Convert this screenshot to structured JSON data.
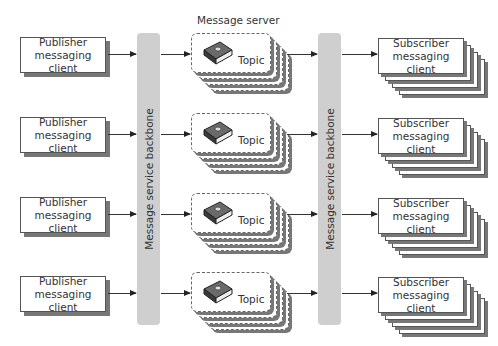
{
  "diagram": {
    "title": "Message server",
    "backbones": [
      {
        "label": "Message service backbone"
      },
      {
        "label": "Message service backbone"
      }
    ],
    "rows": [
      {
        "publisher": {
          "line1": "Publisher",
          "line2": "messaging client"
        },
        "topic": {
          "label": "Topic",
          "icon": "book-icon"
        },
        "subscriber": {
          "line1": "Subscriber",
          "line2": "messaging client"
        }
      },
      {
        "publisher": {
          "line1": "Publisher",
          "line2": "messaging client"
        },
        "topic": {
          "label": "Topic",
          "icon": "book-icon"
        },
        "subscriber": {
          "line1": "Subscriber",
          "line2": "messaging client"
        }
      },
      {
        "publisher": {
          "line1": "Publisher",
          "line2": "messaging client"
        },
        "topic": {
          "label": "Topic",
          "icon": "book-icon"
        },
        "subscriber": {
          "line1": "Subscriber",
          "line2": "messaging client"
        }
      },
      {
        "publisher": {
          "line1": "Publisher",
          "line2": "messaging client"
        },
        "topic": {
          "label": "Topic",
          "icon": "book-icon"
        },
        "subscriber": {
          "line1": "Subscriber",
          "line2": "messaging client"
        }
      }
    ],
    "colors": {
      "backbone": "#cfcfcf",
      "shadow": "#777777",
      "border": "#555555"
    }
  }
}
